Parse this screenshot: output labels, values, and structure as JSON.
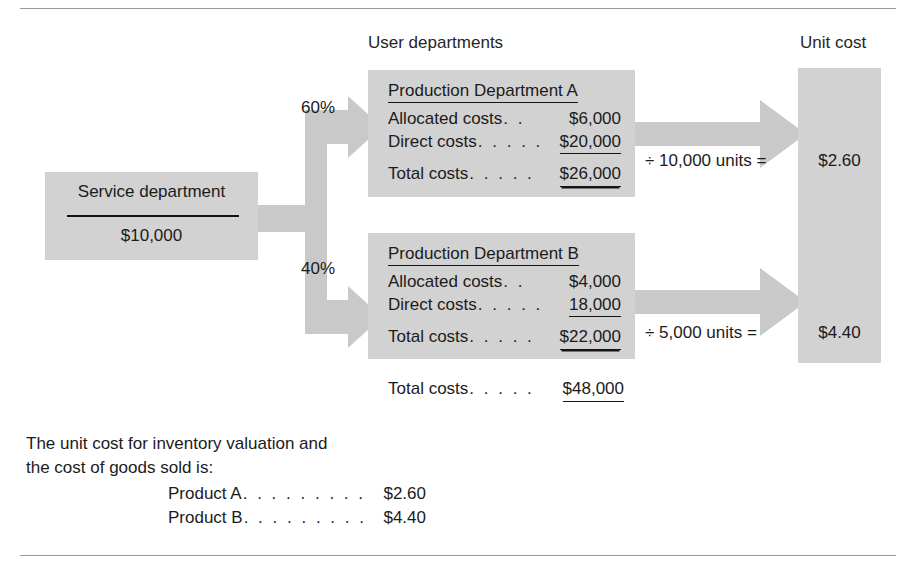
{
  "diagram": {
    "column_labels": {
      "user_departments": "User departments",
      "unit_cost": "Unit cost"
    },
    "service_department": {
      "title": "Service department",
      "amount": "$10,000"
    },
    "allocations": [
      {
        "percent": "60%"
      },
      {
        "percent": "40%"
      }
    ],
    "departments": [
      {
        "title": "Production Department A",
        "rows": [
          {
            "label": "Allocated costs",
            "dots": ". .",
            "value": "$6,000",
            "underline": "none"
          },
          {
            "label": "Direct costs",
            "dots": ". . . . .",
            "value": "$20,000",
            "underline": "single"
          },
          {
            "label": "Total costs",
            "dots": ". . . . .",
            "value": "$26,000",
            "underline": "double"
          }
        ],
        "divisor_text": "÷ 10,000 units =",
        "unit_cost": "$2.60"
      },
      {
        "title": "Production Department B",
        "rows": [
          {
            "label": "Allocated costs",
            "dots": ". .",
            "value": "$4,000",
            "underline": "none"
          },
          {
            "label": "Direct costs",
            "dots": ". . . . .",
            "value": "18,000",
            "underline": "single"
          },
          {
            "label": "Total costs",
            "dots": ". . . . .",
            "value": "$22,000",
            "underline": "double"
          }
        ],
        "divisor_text": "÷ 5,000 units =",
        "unit_cost": "$4.40"
      }
    ],
    "grand_total": {
      "label": "Total costs",
      "dots": ". . . . .",
      "value": "$48,000",
      "underline": "single"
    },
    "note": {
      "line1": "The unit cost for inventory valuation and",
      "line2": "the cost of goods sold is:",
      "products": [
        {
          "label": "Product A",
          "dots": ". . . . . . . . .",
          "value": "$2.60"
        },
        {
          "label": "Product B",
          "dots": ". . . . . . . . .",
          "value": "$4.40"
        }
      ]
    },
    "colors": {
      "box_fill": "#d2d2d2",
      "arrow_fill": "#c9c9c9",
      "text": "#1b1b1b",
      "rule": "#9a9a9a"
    }
  }
}
